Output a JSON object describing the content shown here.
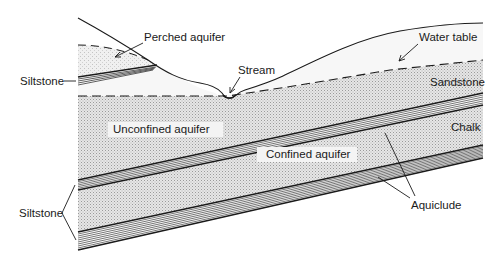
{
  "figure": {
    "type": "geological cross-section"
  },
  "labels": {
    "perched_aquifer": "Perched aquifer",
    "water_table": "Water table",
    "stream": "Stream",
    "siltstone_upper": "Siltstone",
    "sandstone": "Sandstone",
    "unconfined_aquifer": "Unconfined aquifer",
    "chalk": "Chalk",
    "confined_aquifer": "Confined aquifer",
    "siltstone_lower": "Siltstone",
    "aquiclude": "Aquiclude"
  },
  "colors": {
    "line": "#1a1a1a",
    "stipple_fill": "#d9d9d9",
    "light_fill": "#ececec",
    "background": "#ffffff"
  },
  "layers": [
    {
      "name": "Sandstone",
      "role": "Unconfined aquifer"
    },
    {
      "name": "Siltstone",
      "role": "Aquiclude"
    },
    {
      "name": "Chalk",
      "role": "Confined aquifer"
    },
    {
      "name": "Siltstone",
      "role": "Aquiclude"
    }
  ]
}
